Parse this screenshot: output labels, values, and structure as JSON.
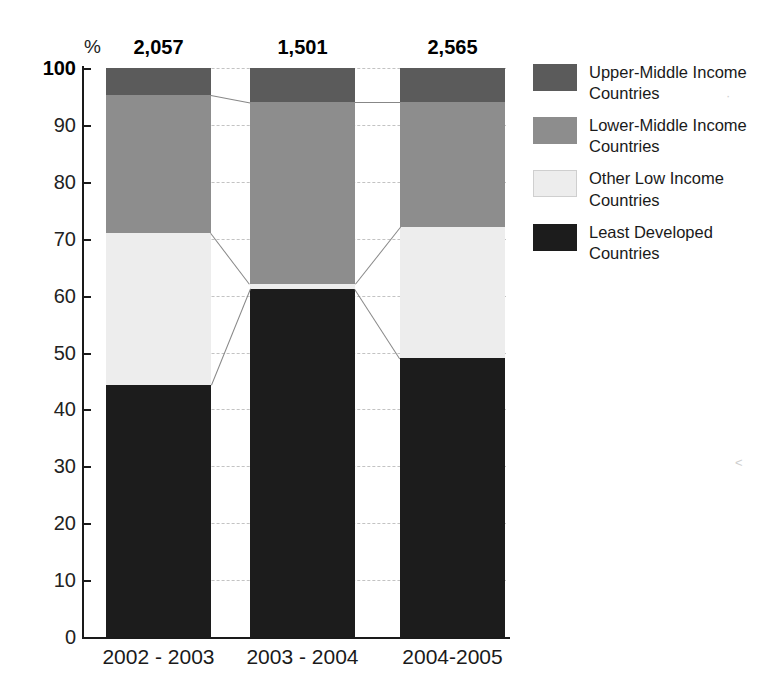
{
  "chart_data": {
    "type": "bar",
    "subtype": "stacked-100-percent",
    "title": "",
    "xlabel": "",
    "ylabel": "%",
    "ylim": [
      0,
      100
    ],
    "ytick_step": 10,
    "yticks": [
      "0",
      "10",
      "20",
      "30",
      "40",
      "50",
      "60",
      "70",
      "80",
      "90",
      "100"
    ],
    "grid": true,
    "legend_position": "right",
    "categories": [
      "2002 - 2003",
      "2003 - 2004",
      "2004-2005"
    ],
    "bar_totals": [
      "2,057",
      "1,501",
      "2,565"
    ],
    "series": [
      {
        "name": "Upper-Middle Income Countries",
        "color": "#5b5b5b",
        "values": [
          4.7,
          6.0,
          6.0
        ]
      },
      {
        "name": "Lower-Middle Income Countries",
        "color": "#8d8d8d",
        "values": [
          24.3,
          32.0,
          22.0
        ]
      },
      {
        "name": "Other Low Income Countries",
        "color": "#ededed",
        "values": [
          26.7,
          0.8,
          23.0
        ]
      },
      {
        "name": "Least Developed Countries",
        "color": "#1c1c1c",
        "values": [
          44.3,
          61.2,
          49.0
        ]
      }
    ],
    "cumulative_tops": {
      "2002 - 2003": {
        "least_developed": 44.3,
        "other_low": 71.0,
        "lower_middle": 95.3,
        "upper_middle": 100
      },
      "2003 - 2004": {
        "least_developed": 61.2,
        "other_low": 62.0,
        "lower_middle": 94.0,
        "upper_middle": 100
      },
      "2004-2005": {
        "least_developed": 49.0,
        "other_low": 72.0,
        "lower_middle": 94.0,
        "upper_middle": 100
      }
    }
  },
  "axis": {
    "percent_symbol": "%",
    "ticks": [
      {
        "label": "100",
        "value": 100,
        "bold": true
      },
      {
        "label": "90",
        "value": 90,
        "bold": false
      },
      {
        "label": "80",
        "value": 80,
        "bold": false
      },
      {
        "label": "70",
        "value": 70,
        "bold": false
      },
      {
        "label": "60",
        "value": 60,
        "bold": false
      },
      {
        "label": "50",
        "value": 50,
        "bold": false
      },
      {
        "label": "40",
        "value": 40,
        "bold": false
      },
      {
        "label": "30",
        "value": 30,
        "bold": false
      },
      {
        "label": "20",
        "value": 20,
        "bold": false
      },
      {
        "label": "10",
        "value": 10,
        "bold": false
      },
      {
        "label": "0",
        "value": 0,
        "bold": false
      }
    ]
  },
  "legend": {
    "items": [
      {
        "label": "Upper-Middle Income Countries",
        "color": "#5b5b5b",
        "key": "upper-middle"
      },
      {
        "label": "Lower-Middle Income Countries",
        "color": "#8d8d8d",
        "key": "lower-middle"
      },
      {
        "label": "Other Low Income Countries",
        "color": "#ededed",
        "key": "other-low"
      },
      {
        "label": "Least Developed Countries",
        "color": "#1c1c1c",
        "key": "least-dev"
      }
    ]
  }
}
